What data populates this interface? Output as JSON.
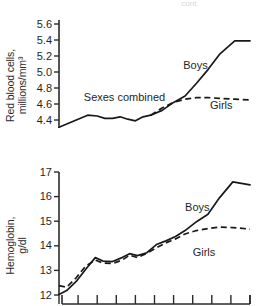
{
  "figure": {
    "top_partial_note": "cont.",
    "background": "#ffffff",
    "line_color": "#191919",
    "axis_color": "#2b2b2b"
  },
  "chart_data": [
    {
      "type": "line",
      "title": "",
      "panel": "top",
      "xlabel": "",
      "ylabel": "Red blood cells, millions/mm3",
      "ylabel_lines": [
        "Red blood cells,",
        "millions/mm³"
      ],
      "ylim": [
        4.3,
        5.65
      ],
      "yticks": [
        4.4,
        4.6,
        4.8,
        5.0,
        5.2,
        5.4,
        5.6
      ],
      "ytick_labels": [
        "4.4",
        "4.6",
        "4.8",
        "5.0",
        "5.2",
        "5.4",
        "5.6"
      ],
      "xlim": [
        0,
        10
      ],
      "xticks": [
        0,
        1,
        2,
        3,
        4,
        5,
        6,
        7,
        8,
        9,
        10
      ],
      "xtick_labels": [
        "",
        "",
        "",
        "",
        "",
        "",
        "",
        "",
        "",
        "",
        ""
      ],
      "grid": false,
      "legend_position": "inline-annotations",
      "annotations": [
        {
          "text": "Sexes combined",
          "x": 1.3,
          "y": 4.68
        },
        {
          "text": "Boys",
          "x": 6.5,
          "y": 5.08
        },
        {
          "text": "Girls",
          "x": 7.9,
          "y": 4.58
        }
      ],
      "series": [
        {
          "name": "Sexes combined",
          "style": "solid",
          "x": [
            0.0,
            0.5,
            1.0,
            1.5,
            2.0,
            2.4,
            2.8,
            3.2,
            3.6,
            4.0,
            4.4,
            4.8
          ],
          "values": [
            4.31,
            4.36,
            4.41,
            4.46,
            4.45,
            4.42,
            4.42,
            4.44,
            4.41,
            4.39,
            4.44,
            4.46
          ]
        },
        {
          "name": "Boys",
          "style": "solid",
          "x": [
            4.8,
            5.4,
            6.0,
            6.6,
            7.2,
            7.8,
            8.4,
            9.2,
            10.0
          ],
          "values": [
            4.46,
            4.52,
            4.62,
            4.7,
            4.86,
            5.03,
            5.22,
            5.39,
            5.39
          ]
        },
        {
          "name": "Girls",
          "style": "dashed",
          "x": [
            4.8,
            5.4,
            6.0,
            6.6,
            7.2,
            7.8,
            8.4,
            9.2,
            10.0
          ],
          "values": [
            4.46,
            4.55,
            4.62,
            4.66,
            4.68,
            4.68,
            4.67,
            4.66,
            4.65
          ]
        }
      ]
    },
    {
      "type": "line",
      "title": "",
      "panel": "bottom",
      "xlabel": "",
      "ylabel": "Hemoglobin, g/dl",
      "ylabel_lines": [
        "Hemoglobin,",
        "g/dl"
      ],
      "ylim": [
        12.0,
        17.0
      ],
      "yticks": [
        12,
        13,
        14,
        15,
        16,
        17
      ],
      "ytick_labels": [
        "12",
        "13",
        "14",
        "15",
        "16",
        "17"
      ],
      "xlim": [
        0,
        10
      ],
      "xticks": [
        0,
        1,
        2,
        3,
        4,
        5,
        6,
        7,
        8,
        9,
        10
      ],
      "xtick_labels": [
        "",
        "",
        "",
        "",
        "",
        "",
        "",
        "",
        "",
        "",
        ""
      ],
      "grid": false,
      "legend_position": "inline-annotations",
      "annotations": [
        {
          "text": "Boys",
          "x": 6.6,
          "y": 15.55
        },
        {
          "text": "Girls",
          "x": 7.0,
          "y": 13.72
        }
      ],
      "series": [
        {
          "name": "Boys",
          "style": "solid",
          "x": [
            0.0,
            0.4,
            0.9,
            1.4,
            1.9,
            2.3,
            2.8,
            3.3,
            3.7,
            4.1,
            4.6,
            5.1,
            5.6,
            6.1,
            6.6,
            7.2,
            7.8,
            8.4,
            9.1,
            10.0
          ],
          "values": [
            12.02,
            12.18,
            12.55,
            13.05,
            13.52,
            13.38,
            13.36,
            13.52,
            13.68,
            13.6,
            13.72,
            14.05,
            14.2,
            14.38,
            14.62,
            14.98,
            15.28,
            15.95,
            16.6,
            16.48
          ]
        },
        {
          "name": "Girls",
          "style": "dashed",
          "x": [
            0.0,
            0.4,
            0.9,
            1.4,
            1.9,
            2.3,
            2.8,
            3.3,
            3.7,
            4.1,
            4.6,
            5.1,
            5.6,
            6.1,
            6.6,
            7.2,
            7.8,
            8.4,
            9.1,
            10.0
          ],
          "values": [
            12.38,
            12.32,
            12.7,
            13.18,
            13.42,
            13.3,
            13.28,
            13.42,
            13.62,
            13.52,
            13.7,
            13.92,
            14.12,
            14.28,
            14.48,
            14.62,
            14.7,
            14.76,
            14.74,
            14.68
          ]
        }
      ]
    }
  ]
}
